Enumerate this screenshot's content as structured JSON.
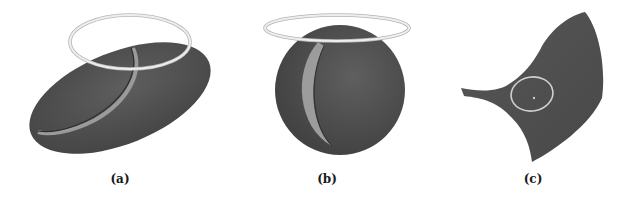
{
  "figure": {
    "colors": {
      "surface": "#565656",
      "surface_dark": "#3e3e3e",
      "ring": "#e4e4e4",
      "ring_edge": "#b0b0b0",
      "crease_light": "#9a9a9a",
      "background": "#ffffff"
    },
    "panels": [
      {
        "id": "a",
        "caption": "(a)",
        "description": "Ellipsoidal disc surface with a loop above and a curved crease"
      },
      {
        "id": "b",
        "caption": "(b)",
        "description": "Sphere with a loop above and a crescent crease"
      },
      {
        "id": "c",
        "caption": "(c)",
        "description": "Saddle-shaped surface with a small circle around a central point"
      }
    ]
  }
}
